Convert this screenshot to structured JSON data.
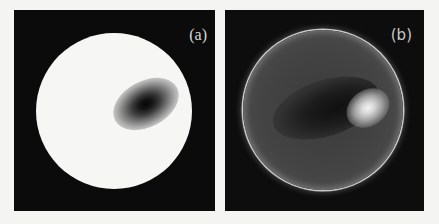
{
  "figure": {
    "panels": [
      {
        "label": "(a)",
        "description": "White circular aperture on black background with a dark elliptical spot right of center"
      },
      {
        "label": "(b)",
        "description": "Dark circular aperture with bright rim on black background, bright spot right of center with dark region to its left"
      }
    ]
  },
  "colors": {
    "background": "#f4f4f2",
    "panel": "#0b0b0b",
    "disk_a": "#f6f6f4",
    "rim_b": "#c9c9c9"
  }
}
